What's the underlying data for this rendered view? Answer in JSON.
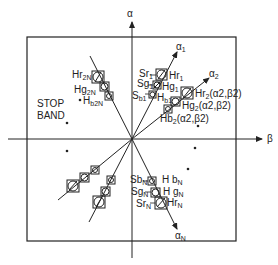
{
  "axes": {
    "vertical_label": "α",
    "horizontal_label": "β"
  },
  "region_label": "STOP\nBAND",
  "region_label_lines": [
    "STOP",
    "BAND"
  ],
  "rays": [
    {
      "name": "alpha-1",
      "label": "α",
      "sub": "1"
    },
    {
      "name": "alpha-2",
      "label": "α",
      "sub": "2"
    },
    {
      "name": "alpha-N",
      "label": "α",
      "sub": "N"
    }
  ],
  "labels": {
    "Sr1": {
      "main": "Sr",
      "sub": "1"
    },
    "Hr1": {
      "main": "Hr",
      "sub": "1"
    },
    "Sg1": {
      "main": "Sg",
      "sub": "1"
    },
    "Hg1": {
      "main": "Hg",
      "sub": "1"
    },
    "Sb1": {
      "main": "S",
      "sub": "b1"
    },
    "Hb1": {
      "main": "H",
      "sub": "b1"
    },
    "Hr2": {
      "main": "Hr",
      "sub": "2",
      "tail": "(α2,β2)"
    },
    "Hg2": {
      "main": "Hg",
      "sub": "2",
      "tail": "(α2,β2)"
    },
    "Hb2": {
      "main": "Hb",
      "sub": "2",
      "tail": "(α2,β2)"
    },
    "Hr2N": {
      "main": "Hr",
      "sub": "2N"
    },
    "Hg2N": {
      "main": "Hg",
      "sub": "2N"
    },
    "Hb2N": {
      "main": "H",
      "sub": "b2N"
    },
    "SbN": {
      "main": "Sb",
      "sub": "N"
    },
    "HbN": {
      "main": "H b",
      "sub": "N"
    },
    "SgN": {
      "main": "Sg",
      "sub": "N"
    },
    "HgN": {
      "main": "H g",
      "sub": "N"
    },
    "SrN": {
      "main": "Sr",
      "sub": "N"
    },
    "HrN": {
      "main": "Hr",
      "sub": "N"
    }
  },
  "stop_band_points": [
    {
      "x": 67,
      "y": 123
    },
    {
      "x": 80,
      "y": 100
    },
    {
      "x": 198,
      "y": 126
    },
    {
      "x": 195,
      "y": 148
    },
    {
      "x": 188,
      "y": 169
    },
    {
      "x": 67,
      "y": 151
    }
  ]
}
